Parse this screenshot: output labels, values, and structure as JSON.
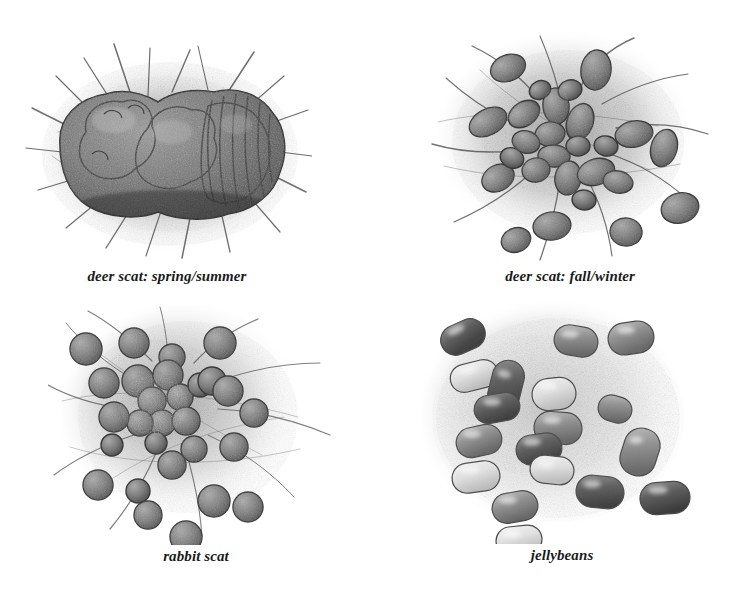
{
  "page": {
    "medium": "graphite pencil drawing",
    "background_color": "#ffffff",
    "ink_color": "#1a1a1a",
    "width": 738,
    "height": 605
  },
  "panels": [
    {
      "id": "deer-spring-summer",
      "caption": "deer scat: spring/summer",
      "subject": "deer scat",
      "form": "single lumpy amorphous clumped mass with segmented ridges at right",
      "texture": "dense graphite shading with radiating straw and grass strokes",
      "tone": {
        "mass": "#6e6e6e",
        "halo": "#b9b9b9",
        "outline": "#3a3a3a"
      },
      "caption_x": 166,
      "caption_y": 274
    },
    {
      "id": "deer-fall-winter",
      "caption": "deer scat: fall/winter",
      "subject": "deer scat",
      "form": "cluster of about 26 oval pellets, clumped at centre and scattered outward",
      "texture": "stippled graphite pellets over a soft grey ground with grass blades",
      "tone": {
        "mass": "#7a7a7a",
        "halo": "#c2c2c2",
        "outline": "#3f3f3f"
      },
      "pellet_count": 26,
      "pellet_shape": "oval",
      "caption_x": 572,
      "caption_y": 274
    },
    {
      "id": "rabbit",
      "caption": "rabbit scat",
      "subject": "rabbit scat",
      "form": "cluster of about 28 round pellets, dark dense centre with outward scatter",
      "texture": "stippled graphite spheres over a soft grey ground with long grass strokes",
      "tone": {
        "mass": "#7d7d7d",
        "halo": "#c6c6c6",
        "outline": "#3f3f3f"
      },
      "pellet_count": 28,
      "pellet_shape": "round",
      "caption_x": 192,
      "caption_y": 554
    },
    {
      "id": "jellybeans",
      "caption": "jellybeans",
      "subject": "jellybeans",
      "form": "about 18 loose bean shapes of varied tone, light, mid and dark",
      "texture": "smooth graduated shading with glossy top highlights on a stippled ground",
      "tone": {
        "dark": "#5e5e5e",
        "mid": "#9a9a9a",
        "light": "#e2e2e2",
        "outline": "#4a4a4a"
      },
      "bean_count": 18,
      "bean_shape": "rounded bean",
      "caption_x": 568,
      "caption_y": 554
    }
  ]
}
